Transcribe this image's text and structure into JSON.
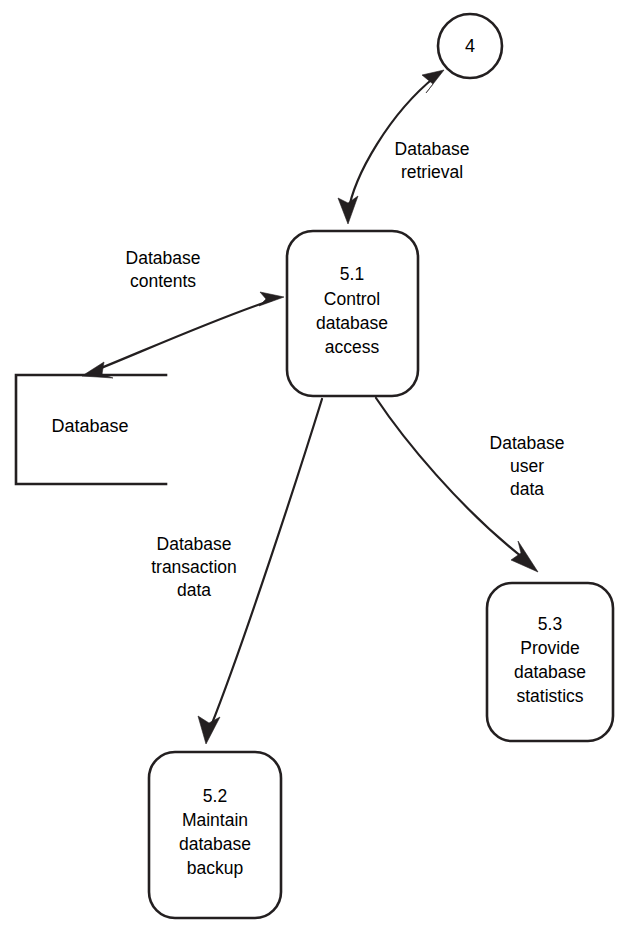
{
  "diagram": {
    "type": "data-flow-diagram",
    "background_color": "#ffffff",
    "line_color": "#231f20",
    "text_color": "#000000"
  },
  "external_entities": [
    {
      "id": "entity-4",
      "label": "4",
      "shape": "circle",
      "cx": 470,
      "cy": 46,
      "r": 32
    }
  ],
  "processes": [
    {
      "id": "process-5-1",
      "number": "5.1",
      "lines": [
        "5.1",
        "Control",
        "database",
        "access"
      ],
      "x": 287,
      "y": 231,
      "width": 131,
      "height": 165
    },
    {
      "id": "process-5-2",
      "number": "5.2",
      "lines": [
        "5.2",
        "Maintain",
        "database",
        "backup"
      ],
      "x": 149,
      "y": 752,
      "width": 132,
      "height": 166
    },
    {
      "id": "process-5-3",
      "number": "5.3",
      "lines": [
        "5.3",
        "Provide",
        "database",
        "statistics"
      ],
      "x": 487,
      "y": 583,
      "width": 126,
      "height": 158
    }
  ],
  "data_stores": [
    {
      "id": "store-database",
      "label": "Database",
      "x": 16,
      "y": 374,
      "width": 150,
      "height": 111
    }
  ],
  "flows": [
    {
      "id": "flow-database-retrieval",
      "label_lines": [
        "Database",
        "retrieval"
      ],
      "from": "process-5-1",
      "to": "entity-4",
      "direction": "bidirectional",
      "label_x": 432,
      "label_y": 160
    },
    {
      "id": "flow-database-contents",
      "label_lines": [
        "Database",
        "contents"
      ],
      "from": "store-database",
      "to": "process-5-1",
      "direction": "bidirectional",
      "label_x": 163,
      "label_y": 269
    },
    {
      "id": "flow-database-user-data",
      "label_lines": [
        "Database",
        "user",
        "data"
      ],
      "from": "process-5-1",
      "to": "process-5-3",
      "direction": "forward",
      "label_x": 525,
      "label_y": 466
    },
    {
      "id": "flow-database-transaction-data",
      "label_lines": [
        "Database",
        "transaction",
        "data"
      ],
      "from": "process-5-1",
      "to": "process-5-2",
      "direction": "forward",
      "label_x": 194,
      "label_y": 567
    }
  ],
  "labels": {
    "entity_4": "4",
    "process_5_1_number": "5.1",
    "process_5_1_l1": "Control",
    "process_5_1_l2": "database",
    "process_5_1_l3": "access",
    "process_5_2_number": "5.2",
    "process_5_2_l1": "Maintain",
    "process_5_2_l2": "database",
    "process_5_2_l3": "backup",
    "process_5_3_number": "5.3",
    "process_5_3_l1": "Provide",
    "process_5_3_l2": "database",
    "process_5_3_l3": "statistics",
    "store_database": "Database",
    "flow_retrieval_l1": "Database",
    "flow_retrieval_l2": "retrieval",
    "flow_contents_l1": "Database",
    "flow_contents_l2": "contents",
    "flow_user_l1": "Database",
    "flow_user_l2": "user",
    "flow_user_l3": "data",
    "flow_transaction_l1": "Database",
    "flow_transaction_l2": "transaction",
    "flow_transaction_l3": "data"
  }
}
